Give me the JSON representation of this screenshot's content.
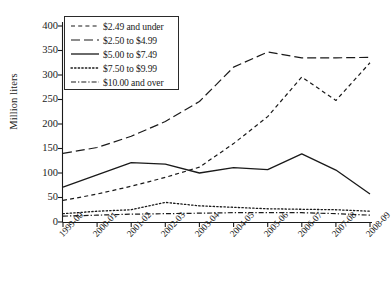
{
  "chart_data": {
    "type": "line",
    "title": "",
    "xlabel": "",
    "ylabel": "Million liters",
    "ylim": [
      0,
      400
    ],
    "yticks": [
      0,
      50,
      100,
      150,
      200,
      250,
      300,
      350,
      400
    ],
    "grid": false,
    "legend_position": "top-left",
    "categories": [
      "1999-00",
      "2000-01",
      "2001-02",
      "2002-03",
      "2003-04",
      "2004-05",
      "2005-06",
      "2006-07",
      "2007-08",
      "2008-09"
    ],
    "series": [
      {
        "name": "$2.49 and under",
        "style": "short-dash",
        "values": [
          44,
          57,
          73,
          91,
          112,
          160,
          215,
          296,
          248,
          325
        ]
      },
      {
        "name": "$2.50 to $4.99",
        "style": "long-dash",
        "values": [
          140,
          152,
          175,
          205,
          246,
          316,
          347,
          335,
          335,
          336
        ]
      },
      {
        "name": "$5.00 to $7.49",
        "style": "solid",
        "values": [
          71,
          96,
          121,
          118,
          100,
          111,
          107,
          139,
          106,
          57
        ]
      },
      {
        "name": "$7.50 to $9.99",
        "style": "dotted",
        "values": [
          17,
          22,
          25,
          40,
          33,
          30,
          27,
          26,
          25,
          22
        ]
      },
      {
        "name": "$10.00 and over",
        "style": "dash-dot",
        "values": [
          12,
          14,
          16,
          17,
          18,
          19,
          19,
          19,
          17,
          14
        ]
      }
    ]
  },
  "axis": {
    "ytick_labels": [
      "400",
      "350",
      "300",
      "250",
      "200",
      "150",
      "100",
      "50",
      "0"
    ],
    "xtick_labels": [
      "1999-00",
      "2000-01",
      "2001-02",
      "2002-03",
      "2003-04",
      "2004-05",
      "2005-06",
      "2006-07",
      "2007-08",
      "2008-09"
    ],
    "ylabel": "Million liters"
  },
  "legend": {
    "items": [
      {
        "label": "$2.49 and under",
        "key": "short-dash-key"
      },
      {
        "label": "$2.50 to $4.99",
        "key": "long-dash-key"
      },
      {
        "label": "$5.00 to $7.49",
        "key": "solid-line-key"
      },
      {
        "label": "$7.50 to $9.99",
        "key": "dotted-line-key"
      },
      {
        "label": "$10.00 and over",
        "key": "dash-dot-key"
      }
    ]
  },
  "colors": {
    "ink": "#1a1a1a",
    "background": "#ffffff"
  }
}
